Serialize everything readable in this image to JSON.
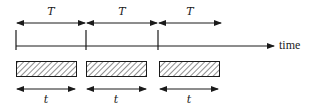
{
  "diagram": {
    "type": "timing-diagram",
    "axis_label": "time",
    "period_label": "T",
    "duration_label": "t",
    "colors": {
      "stroke": "#1a1a1a",
      "background": "#ffffff",
      "hatch": "#333333"
    },
    "periods": [
      {
        "label": "T",
        "x_start": 16,
        "x_end": 86
      },
      {
        "label": "T",
        "x_start": 86,
        "x_end": 158
      },
      {
        "label": "T",
        "x_start": 158,
        "x_end": 221
      }
    ],
    "ticks": [
      16,
      86,
      158
    ],
    "pulses": [
      {
        "label": "t",
        "x_start": 16,
        "x_end": 76
      },
      {
        "label": "t",
        "x_start": 86,
        "x_end": 147
      },
      {
        "label": "t",
        "x_start": 159,
        "x_end": 219
      }
    ]
  }
}
